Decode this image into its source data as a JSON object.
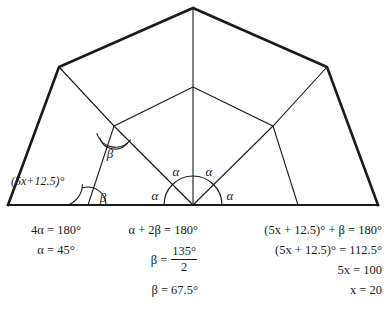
{
  "figure": {
    "stroke_color": "#1a1a1a",
    "outer_stroke_width": 2.4,
    "inner_stroke_width": 1.1,
    "labels": {
      "alpha": "α",
      "beta": "β",
      "expression": "(5x+12.5)°"
    },
    "alpha_labels": [
      {
        "id": "alpha-upper-left",
        "text": "α",
        "x": 176,
        "y": 176
      },
      {
        "id": "alpha-upper-right",
        "text": "α",
        "x": 205,
        "y": 176
      },
      {
        "id": "alpha-lower-left",
        "text": "α",
        "x": 155,
        "y": 199
      },
      {
        "id": "alpha-lower-right",
        "text": "α",
        "x": 226,
        "y": 199
      }
    ],
    "beta_labels": [
      {
        "id": "beta-inner-left",
        "text": "β",
        "x": 109,
        "y": 156
      },
      {
        "id": "beta-base-left",
        "text": "β",
        "x": 101,
        "y": 201
      }
    ],
    "expression_label": {
      "id": "expr-5x-12-5",
      "text": "(5x+12.5)°",
      "x": 12,
      "y": 184
    },
    "vertices": {
      "apex": {
        "x": 193,
        "y": 8
      },
      "shoulder_left": {
        "x": 59,
        "y": 67
      },
      "shoulder_right": {
        "x": 327,
        "y": 67
      },
      "base_left": {
        "x": 8,
        "y": 205
      },
      "base_right": {
        "x": 378,
        "y": 205
      },
      "base_center": {
        "x": 193,
        "y": 205
      },
      "base_left_inner": {
        "x": 88,
        "y": 205
      },
      "base_right_inner": {
        "x": 298,
        "y": 205
      },
      "inner_apex": {
        "x": 193,
        "y": 87
      },
      "inner_left": {
        "x": 114,
        "y": 126
      },
      "inner_right": {
        "x": 273,
        "y": 126
      }
    }
  },
  "equations": {
    "column1": {
      "line1": "4α = 180°",
      "line2": "α = 45°"
    },
    "column2": {
      "line1": "α + 2β = 180°",
      "line2_lhs": "β =",
      "line2_numerator": "135°",
      "line2_denominator": "2",
      "line3": "β = 67.5°"
    },
    "column3": {
      "line1": "(5x + 12.5)° + β = 180°",
      "line2": "(5x + 12.5)° = 112.5°",
      "line3": "5x = 100",
      "line4": "x = 20"
    }
  }
}
